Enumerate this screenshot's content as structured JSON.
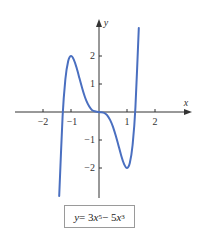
{
  "chart_data": {
    "type": "line",
    "title": "",
    "xlabel": "x",
    "ylabel": "y",
    "xlim": [
      -2.8,
      3.2
    ],
    "ylim": [
      -3.0,
      3.3
    ],
    "x_ticks": [
      -2,
      -1,
      1,
      2
    ],
    "y_ticks": [
      -2,
      -1,
      1,
      2
    ],
    "x_tick_labels": [
      "−2",
      "−1",
      "1",
      "2"
    ],
    "y_tick_labels": [
      "−2",
      "−1",
      "1",
      "2"
    ],
    "grid": false,
    "legend": null,
    "annotation": "y = 3x^5 − 5x^3",
    "series": [
      {
        "name": "y = 3x^5 - 5x^3",
        "color": "#4a6fc0",
        "x": [
          -1.42,
          -1.3,
          -1.2,
          -1.1,
          -1.0,
          -0.9,
          -0.8,
          -0.7,
          -0.6,
          -0.5,
          -0.4,
          -0.3,
          -0.2,
          0,
          0.2,
          0.3,
          0.4,
          0.5,
          0.6,
          0.7,
          0.8,
          0.9,
          1.0,
          1.1,
          1.2,
          1.3,
          1.42
        ],
        "y": [
          -3.0,
          -0.15,
          1.18,
          1.82,
          2.0,
          1.87,
          1.58,
          1.21,
          0.85,
          0.53,
          0.29,
          0.13,
          0.04,
          0,
          -0.04,
          -0.13,
          -0.29,
          -0.53,
          -0.85,
          -1.21,
          -1.58,
          -1.87,
          -2.0,
          -1.82,
          -1.18,
          0.15,
          3.0
        ]
      }
    ],
    "key_points": {
      "local_max": [
        -1,
        2
      ],
      "local_min": [
        1,
        -2
      ],
      "inflection": [
        0,
        0
      ]
    }
  },
  "labels": {
    "x_axis": "x",
    "y_axis": "y",
    "ticks_x": [
      "−2",
      "−1",
      "1",
      "2"
    ],
    "ticks_y": [
      "2",
      "1",
      "−1",
      "−2"
    ],
    "formula": {
      "lhs": "y",
      "eq": " = 3",
      "var1": "x",
      "exp1": "5",
      "minus": " − 5",
      "var2": "x",
      "exp2": "3"
    }
  },
  "colors": {
    "curve": "#4a6fc0",
    "axis": "#333333",
    "box_border": "#9a9a9a"
  }
}
